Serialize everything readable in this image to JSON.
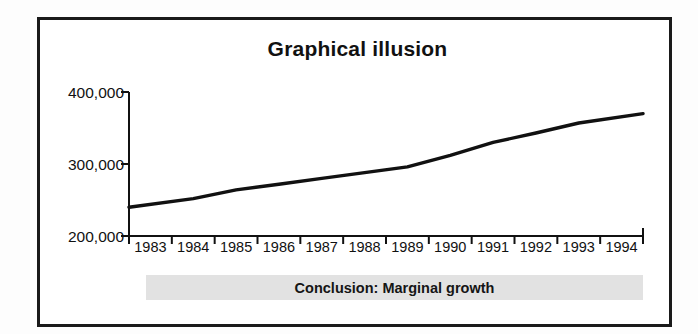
{
  "figure": {
    "title": "Graphical illusion",
    "conclusion_label": "Conclusion: Marginal growth",
    "frame_color": "#1a1a1a",
    "line_color": "#111111",
    "banner_color": "#e2e2e2",
    "background_color": "#ffffff"
  },
  "ghost": {
    "top_line": "",
    "bottom_line": ""
  },
  "chart_data": {
    "type": "line",
    "title": "Graphical illusion",
    "xlabel": "",
    "ylabel": "",
    "grid": false,
    "legend": "none",
    "annotations": [
      "Conclusion: Marginal growth"
    ],
    "categories": [
      "1983",
      "1984",
      "1985",
      "1986",
      "1987",
      "1988",
      "1989",
      "1990",
      "1991",
      "1992",
      "1993",
      "1994"
    ],
    "x": [
      1983,
      1984,
      1985,
      1986,
      1987,
      1988,
      1989,
      1990,
      1991,
      1992,
      1993,
      1994
    ],
    "values": [
      240000,
      252000,
      264000,
      272000,
      280000,
      288000,
      296000,
      312000,
      330000,
      343000,
      357000,
      370000
    ],
    "ylim": [
      200000,
      400000
    ],
    "yticks": [
      200000,
      300000,
      400000
    ],
    "ytick_labels": [
      "200,000",
      "300,000",
      "400,000"
    ],
    "xtick_labels": [
      "1983",
      "1984",
      "1985",
      "1986",
      "1987",
      "1988",
      "1989",
      "1990",
      "1991",
      "1992",
      "1993",
      "1994"
    ],
    "series": [
      {
        "name": "value",
        "values": [
          240000,
          252000,
          264000,
          272000,
          280000,
          288000,
          296000,
          312000,
          330000,
          343000,
          357000,
          370000
        ]
      }
    ]
  }
}
